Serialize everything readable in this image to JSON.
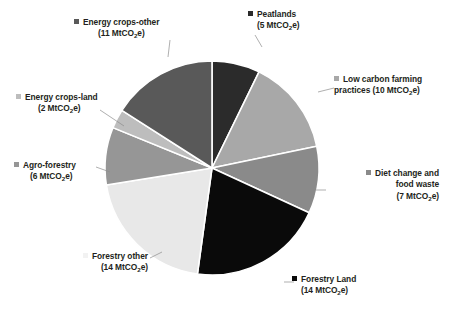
{
  "chart_data": {
    "type": "pie",
    "title": "",
    "unit": "MtCO2e",
    "total": 69,
    "start_angle_deg": 0,
    "direction": "clockwise",
    "legend": "external-labels-with-leader-lines",
    "categories": [
      "Peatlands",
      "Low carbon farming practices",
      "Diet change and food waste",
      "Forestry Land",
      "Forestry other",
      "Agro-forestry",
      "Energy crops-land",
      "Energy crops-other"
    ],
    "values": [
      5,
      10,
      7,
      14,
      14,
      6,
      2,
      11
    ],
    "colors": [
      "#2b2b2b",
      "#a8a8a8",
      "#8a8a8a",
      "#0a0a0a",
      "#e8e8e8",
      "#969696",
      "#bdbdbd",
      "#595959"
    ],
    "slice_border_color": "#ffffff",
    "series": [
      {
        "name": "Abatement potential",
        "values": [
          5,
          10,
          7,
          14,
          14,
          6,
          2,
          11
        ]
      }
    ]
  },
  "pie": {
    "center_x": 212,
    "center_y": 168,
    "radius": 107,
    "slices": [
      {
        "name": "Peatlands",
        "value": 5,
        "color": "#2b2b2b"
      },
      {
        "name": "Low carbon farming practices",
        "value": 10,
        "color": "#a8a8a8"
      },
      {
        "name": "Diet change and food waste",
        "value": 7,
        "color": "#8a8a8a"
      },
      {
        "name": "Forestry Land",
        "value": 14,
        "color": "#0a0a0a"
      },
      {
        "name": "Forestry other",
        "value": 14,
        "color": "#e8e8e8"
      },
      {
        "name": "Agro-forestry",
        "value": 6,
        "color": "#969696"
      },
      {
        "name": "Energy crops-land",
        "value": 2,
        "color": "#bdbdbd"
      },
      {
        "name": "Energy crops-other",
        "value": 11,
        "color": "#595959"
      }
    ]
  },
  "labels": {
    "peatlands": {
      "line1": "Peatlands",
      "line2_pre": "(5 MtCO",
      "line2_sub": "2",
      "line2_post": "e)",
      "marker_color": "#2b2b2b"
    },
    "low_carbon": {
      "line1": "Low carbon farming",
      "line2_pre": "practices (10 MtCO",
      "line2_sub": "2",
      "line2_post": "e)",
      "marker_color": "#a8a8a8"
    },
    "diet_change": {
      "line1": "Diet change and",
      "line2": "food waste",
      "line3_pre": "(7 MtCO",
      "line3_sub": "2",
      "line3_post": "e)",
      "marker_color": "#8a8a8a"
    },
    "forestry_land": {
      "line1": "Forestry Land",
      "line2_pre": "(14 MtCO",
      "line2_sub": "2",
      "line2_post": "e)",
      "marker_color": "#0a0a0a"
    },
    "forestry_other": {
      "line1": "Forestry other",
      "line2_pre": "(14 MtCO",
      "line2_sub": "2",
      "line2_post": "e)",
      "marker_color": "#f2f2f2"
    },
    "agro_forestry": {
      "line1": "Agro-forestry",
      "line2_pre": "(6 MtCO",
      "line2_sub": "2",
      "line2_post": "e)",
      "marker_color": "#969696"
    },
    "energy_crops_land": {
      "line1": "Energy crops-land",
      "line2_pre": "(2 MtCO",
      "line2_sub": "2",
      "line2_post": "e)",
      "marker_color": "#bdbdbd"
    },
    "energy_crops_other": {
      "line1": "Energy crops-other",
      "line2_pre": "(11 MtCO",
      "line2_sub": "2",
      "line2_post": "e)",
      "marker_color": "#595959"
    }
  }
}
